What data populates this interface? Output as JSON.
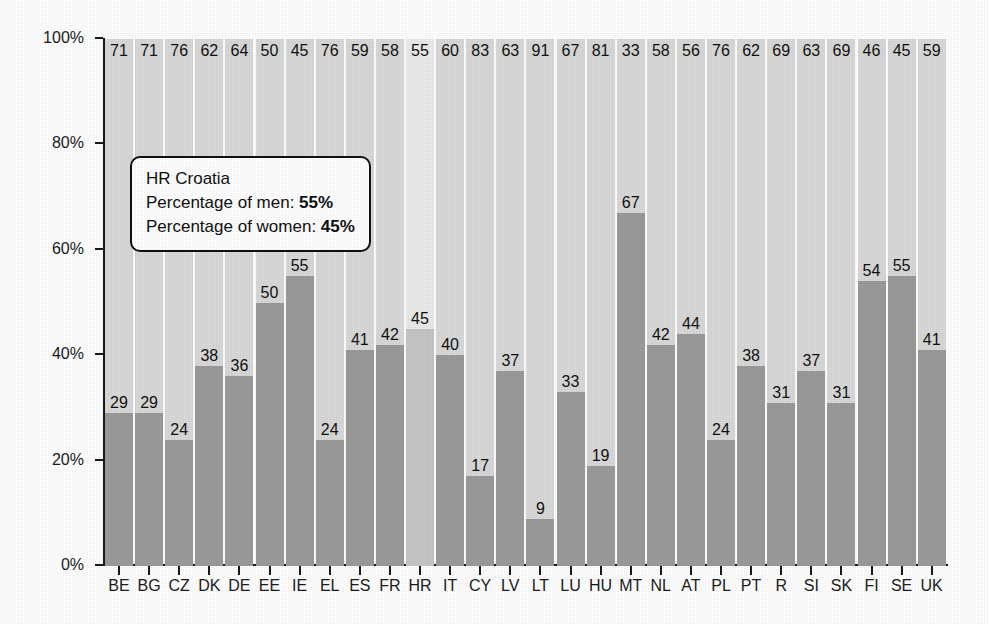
{
  "chart_data": {
    "type": "bar",
    "title": "",
    "subtitle": "",
    "xlabel": "",
    "ylabel": "",
    "ylim": [
      0,
      100
    ],
    "grid": false,
    "legend_position": "none",
    "stacked": true,
    "stack_total": 100,
    "categories": [
      "BE",
      "BG",
      "CZ",
      "DK",
      "DE",
      "EE",
      "IE",
      "EL",
      "ES",
      "FR",
      "HR",
      "IT",
      "CY",
      "LV",
      "LT",
      "LU",
      "HU",
      "MT",
      "NL",
      "AT",
      "PL",
      "PT",
      "R",
      "SI",
      "SK",
      "FI",
      "SE",
      "UK"
    ],
    "series": [
      {
        "name": "Percentage of women",
        "position": "top",
        "color": "#d9d9d9",
        "values": [
          71,
          71,
          76,
          62,
          64,
          50,
          45,
          76,
          59,
          58,
          55,
          60,
          83,
          63,
          91,
          67,
          81,
          33,
          58,
          56,
          76,
          62,
          69,
          63,
          69,
          46,
          45,
          59
        ]
      },
      {
        "name": "Percentage of men",
        "position": "bottom",
        "color": "#9b9b9b",
        "values": [
          29,
          29,
          24,
          38,
          36,
          50,
          55,
          24,
          41,
          42,
          45,
          40,
          17,
          37,
          9,
          33,
          19,
          67,
          42,
          44,
          24,
          38,
          31,
          37,
          31,
          54,
          55,
          41
        ]
      }
    ],
    "highlighted_category": "HR",
    "highlight_colors": {
      "women": "#ebebeb",
      "men": "#c6c6c6"
    },
    "y_ticks": [
      "0%",
      "20%",
      "40%",
      "60%",
      "80%",
      "100%"
    ],
    "y_tick_values": [
      0,
      20,
      40,
      60,
      80,
      100
    ]
  },
  "tooltip": {
    "country_line": "HR Croatia",
    "men_label": "Percentage of men:",
    "men_value": "55%",
    "women_label": "Percentage of women:",
    "women_value": "45%"
  }
}
